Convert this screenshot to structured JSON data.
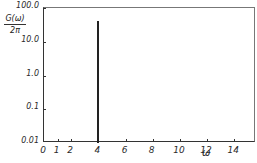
{
  "chart_data": {
    "type": "line",
    "title": "",
    "xlabel": "ω",
    "ylabel_numerator": "G(ω)",
    "ylabel_denominator": "2π",
    "xlim": [
      0,
      15.6
    ],
    "ylim": [
      0.01,
      100.0
    ],
    "yscale": "log",
    "grid": false,
    "x_ticks": [
      "0",
      "1",
      "2",
      "4",
      "6",
      "8",
      "10",
      "12",
      "14"
    ],
    "x_tick_values": [
      0,
      1,
      2,
      4,
      6,
      8,
      10,
      12,
      14
    ],
    "y_ticks": [
      "100.0",
      "10.0",
      "1.0",
      "0.1",
      "0.01"
    ],
    "y_tick_values": [
      100.0,
      10.0,
      1.0,
      0.1,
      0.01
    ],
    "series": [
      {
        "name": "G(ω)/2π spectrum",
        "description": "Single narrow spectral peak at ω ≈ 4",
        "x": [
          3.95,
          4.0,
          4.05
        ],
        "values": [
          0.01,
          40.0,
          0.01
        ]
      }
    ]
  }
}
